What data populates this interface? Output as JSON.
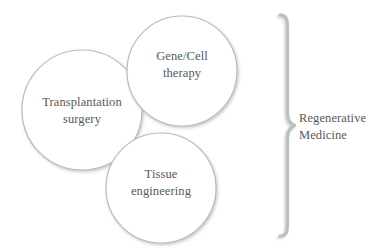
{
  "diagram": {
    "type": "venn-like-circles-with-brace",
    "background_color": "#ffffff",
    "circle_stroke_color": "#b9bbbd",
    "brace_color": "#bcbec0",
    "text_color": "#58585a",
    "bubbles": [
      {
        "id": "transplantation",
        "label": "Transplantation\nsurgery",
        "cx": 82,
        "cy": 110,
        "r": 60
      },
      {
        "id": "gene-cell-therapy",
        "label": "Gene/Cell\ntherapy",
        "cx": 182,
        "cy": 71,
        "r": 55
      },
      {
        "id": "tissue-engineering",
        "label": "Tissue\nengineering",
        "cx": 161,
        "cy": 188,
        "r": 55
      }
    ],
    "grouping": {
      "brace_label": "Regenerative\nMedicine",
      "brace_top": 14,
      "brace_bottom": 237,
      "brace_apex_y": 126
    }
  }
}
